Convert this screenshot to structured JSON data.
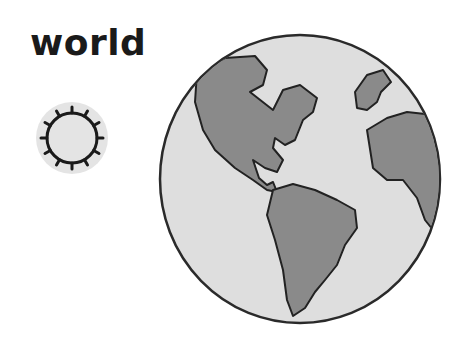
{
  "title": "world",
  "icon": {
    "name": "sun-icon",
    "background": "#e4e4e4",
    "stroke": "#1a1a1a"
  },
  "globe": {
    "name": "globe-icon",
    "ocean_color": "#dedede",
    "land_color": "#8a8a8a",
    "outline_color": "#2a2a2a",
    "continents": [
      "North America",
      "South America",
      "Europe",
      "Africa"
    ]
  }
}
